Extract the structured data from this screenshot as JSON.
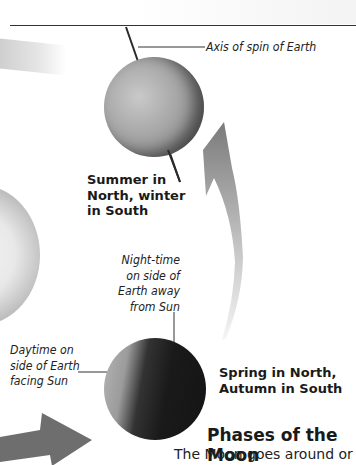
{
  "labels": {
    "axis": "Axis of spin of Earth",
    "summer": [
      "Summer in",
      "North, winter",
      "in South"
    ],
    "night": [
      "Night-time",
      "on side of",
      "Earth away",
      "from Sun"
    ],
    "daytime": [
      "Daytime on",
      "side of Earth",
      "facing Sun"
    ],
    "spring": [
      "Spring in North,",
      "Autumn in South"
    ]
  },
  "section": {
    "title": "Phases of the Moon",
    "body": "The Moon goes around or"
  },
  "colors": {
    "text": "#1a1a1a",
    "rule": "#333333",
    "arrow": "#6e6e6e"
  }
}
